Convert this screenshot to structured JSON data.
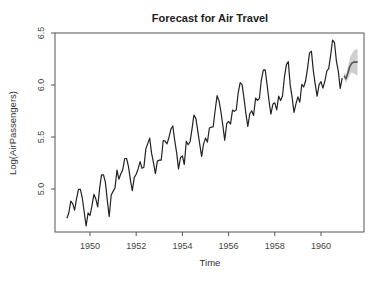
{
  "chart_data": {
    "type": "line",
    "title": "Forecast for Air Travel",
    "xlabel": "Time",
    "ylabel": "Log(AirPassengers)",
    "xlim": [
      1948.8,
      1961.6
    ],
    "ylim": [
      4.62,
      6.5
    ],
    "xticks": [
      1950,
      1952,
      1954,
      1956,
      1958,
      1960
    ],
    "xtick_labels": [
      "1950",
      "1952",
      "1954",
      "1956",
      "1958",
      "1960"
    ],
    "yticks": [
      5.0,
      5.5,
      6.0,
      6.5
    ],
    "ytick_labels": [
      "5.0",
      "5.5",
      "6.0",
      "6.5"
    ],
    "grid": false,
    "legend": null,
    "series": [
      {
        "name": "Log(AirPassengers)",
        "start": 1949.0,
        "frequency": 12,
        "color": "#222222",
        "values": [
          4.718,
          4.771,
          4.883,
          4.86,
          4.796,
          4.905,
          4.997,
          4.997,
          4.913,
          4.779,
          4.644,
          4.771,
          4.745,
          4.836,
          4.949,
          4.905,
          4.828,
          5.004,
          5.136,
          5.136,
          5.063,
          4.89,
          4.736,
          4.942,
          4.977,
          5.011,
          5.182,
          5.094,
          5.147,
          5.182,
          5.293,
          5.293,
          5.215,
          5.088,
          4.984,
          5.112,
          5.142,
          5.193,
          5.263,
          5.199,
          5.209,
          5.384,
          5.438,
          5.489,
          5.342,
          5.252,
          5.147,
          5.268,
          5.278,
          5.278,
          5.464,
          5.46,
          5.434,
          5.493,
          5.576,
          5.606,
          5.468,
          5.352,
          5.193,
          5.303,
          5.318,
          5.236,
          5.46,
          5.425,
          5.455,
          5.576,
          5.71,
          5.68,
          5.557,
          5.434,
          5.313,
          5.434,
          5.489,
          5.451,
          5.587,
          5.595,
          5.598,
          5.753,
          5.897,
          5.849,
          5.743,
          5.613,
          5.468,
          5.628,
          5.649,
          5.624,
          5.759,
          5.746,
          5.762,
          5.924,
          6.023,
          6.004,
          5.872,
          5.724,
          5.602,
          5.724,
          5.753,
          5.707,
          5.875,
          5.852,
          5.872,
          6.045,
          6.142,
          6.146,
          6.001,
          5.849,
          5.72,
          5.817,
          5.829,
          5.762,
          5.892,
          5.852,
          5.894,
          6.075,
          6.196,
          6.225,
          6.001,
          5.883,
          5.737,
          5.82,
          5.886,
          5.835,
          6.006,
          5.981,
          6.04,
          6.157,
          6.306,
          6.326,
          6.138,
          6.009,
          5.892,
          6.004,
          6.033,
          5.969,
          6.038,
          6.133,
          6.157,
          6.282,
          6.433,
          6.407,
          6.23,
          6.133,
          5.966,
          6.068
        ]
      },
      {
        "name": "Forecast",
        "start": 1961.0,
        "frequency": 12,
        "color": "#555555",
        "values": [
          6.09,
          6.06,
          6.12,
          6.18,
          6.21,
          6.22,
          6.22,
          6.22
        ],
        "band_lower": [
          6.06,
          6.02,
          6.06,
          6.1,
          6.12,
          6.11,
          6.1,
          6.09
        ],
        "band_upper": [
          6.12,
          6.1,
          6.18,
          6.26,
          6.3,
          6.33,
          6.34,
          6.35
        ],
        "band_color": "#bbbbbb"
      }
    ]
  }
}
